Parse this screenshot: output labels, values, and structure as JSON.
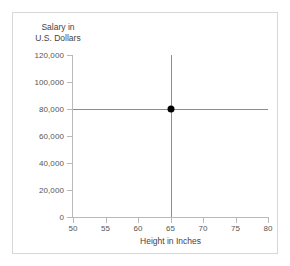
{
  "chart_data": {
    "type": "scatter",
    "title": "",
    "xlabel": "Height in Inches",
    "ylabel": "Salary in U.S. Dollars",
    "ylabel_lines": [
      "Salary in",
      "U.S. Dollars"
    ],
    "xlim": [
      50,
      80
    ],
    "ylim": [
      0,
      120000
    ],
    "xticks": [
      50,
      55,
      60,
      65,
      70,
      75,
      80
    ],
    "xtick_labels": [
      "50",
      "55",
      "60",
      "65",
      "70",
      "75",
      "80"
    ],
    "yticks": [
      0,
      20000,
      40000,
      60000,
      80000,
      100000,
      120000
    ],
    "ytick_labels": [
      "0",
      "20,000",
      "40,000",
      "60,000",
      "80,000",
      "100,000",
      "120,000"
    ],
    "grid": false,
    "legend": null,
    "points": [
      {
        "x": 65,
        "y": 80000,
        "label": ""
      }
    ],
    "reference_lines": [
      {
        "orientation": "horizontal",
        "value": 80000,
        "spans_plot": true
      },
      {
        "orientation": "vertical",
        "value": 65,
        "spans_plot": true
      }
    ],
    "colors": {
      "point": "#000000",
      "reference_line": "#8d8d8d",
      "axis": "#b9b9b9",
      "tick_label": "#555555",
      "axis_title": "#444444",
      "frame": "#d8d8d8",
      "background": "#ffffff"
    }
  }
}
